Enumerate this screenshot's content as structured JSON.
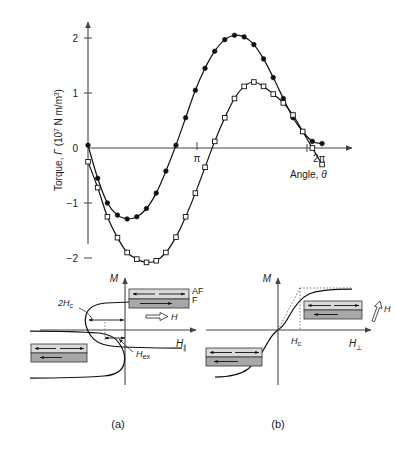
{
  "figure": {
    "panels": [
      {
        "id": "top",
        "caption": ""
      },
      {
        "id": "a",
        "caption": "(a)"
      },
      {
        "id": "b",
        "caption": "(b)"
      }
    ]
  },
  "torque_plot": {
    "ylabel_main": "Torque, ",
    "ylabel_symbol": "Γ",
    "ylabel_units_open": " (10",
    "ylabel_units_exp": "7",
    "ylabel_units_close": " N m/m",
    "ylabel_units_exp2": "3",
    "ylabel_units_end": ")",
    "xlabel_main": "Angle, ",
    "xlabel_symbol": "θ",
    "ytick_labels": [
      "2",
      "1",
      "0",
      "−1",
      "−2"
    ],
    "xtick_labels": [
      "π",
      "2π"
    ],
    "series_names": [
      "filled-circles",
      "open-squares"
    ]
  },
  "chart_data": {
    "type": "line",
    "title": "",
    "xlabel": "Angle, θ",
    "ylabel": "Torque, Γ (10^7 N m/m^3)",
    "xlim": [
      0,
      6.6
    ],
    "ylim": [
      -2.35,
      2.35
    ],
    "xticks": [
      3.14159,
      6.28319
    ],
    "xtick_labels": [
      "π",
      "2π"
    ],
    "yticks": [
      -2,
      -1,
      0,
      1,
      2
    ],
    "ytick_labels": [
      "−2",
      "−1",
      "0",
      "1",
      "2"
    ],
    "grid": false,
    "legend": "none",
    "series": [
      {
        "name": "filled-circles",
        "marker": "filled-circle",
        "color": "#111111",
        "x": [
          0.0,
          0.26,
          0.52,
          0.79,
          1.05,
          1.31,
          1.57,
          1.83,
          2.09,
          2.36,
          2.62,
          2.88,
          3.14,
          3.4,
          3.67,
          3.93,
          4.19,
          4.45,
          4.71,
          4.97,
          5.24,
          5.5,
          5.76,
          6.02,
          6.28
        ],
        "y": [
          0.05,
          -0.55,
          -1.0,
          -1.22,
          -1.29,
          -1.25,
          -1.1,
          -0.82,
          -0.42,
          0.05,
          0.55,
          1.05,
          1.45,
          1.76,
          1.97,
          2.05,
          2.02,
          1.88,
          1.62,
          1.28,
          0.9,
          0.55,
          0.3,
          0.12,
          0.08
        ]
      },
      {
        "name": "open-squares",
        "marker": "open-square",
        "color": "#111111",
        "x": [
          0.0,
          0.26,
          0.52,
          0.79,
          1.05,
          1.31,
          1.57,
          1.83,
          2.09,
          2.36,
          2.62,
          2.88,
          3.14,
          3.4,
          3.67,
          3.93,
          4.19,
          4.45,
          4.71,
          4.97,
          5.24,
          5.5,
          5.76,
          6.02,
          6.28
        ],
        "y": [
          -0.25,
          -0.72,
          -1.25,
          -1.63,
          -1.9,
          -2.02,
          -2.08,
          -2.05,
          -1.9,
          -1.62,
          -1.25,
          -0.82,
          -0.35,
          0.12,
          0.55,
          0.9,
          1.12,
          1.2,
          1.12,
          0.98,
          0.82,
          0.6,
          0.3,
          0.0,
          -0.3
        ]
      }
    ]
  },
  "panel_a": {
    "caption": "(a)",
    "y_axis_label": "M",
    "x_axis_label": "H",
    "x_axis_sub": "∥",
    "annotations": [
      {
        "name": "coercivity-width",
        "label": "2H",
        "sub": "c"
      },
      {
        "name": "exchange-bias",
        "label": "H",
        "sub": "ex"
      }
    ],
    "inset_right": {
      "layer_top_label": "AF",
      "layer_bottom_label": "F",
      "field_label": "H"
    }
  },
  "panel_b": {
    "caption": "(b)",
    "y_axis_label": "M",
    "x_axis_label": "H",
    "x_axis_sub": "⊥",
    "annotations": [
      {
        "name": "anisotropy-field",
        "label": "H",
        "sub": "c"
      }
    ],
    "inset_right": {
      "field_label": "H"
    }
  },
  "colors": {
    "curve": "#111111",
    "axis": "#444444",
    "layer_af": "#d9d9d9",
    "layer_f": "#a8a8a8",
    "text": "#1a1a1a"
  }
}
